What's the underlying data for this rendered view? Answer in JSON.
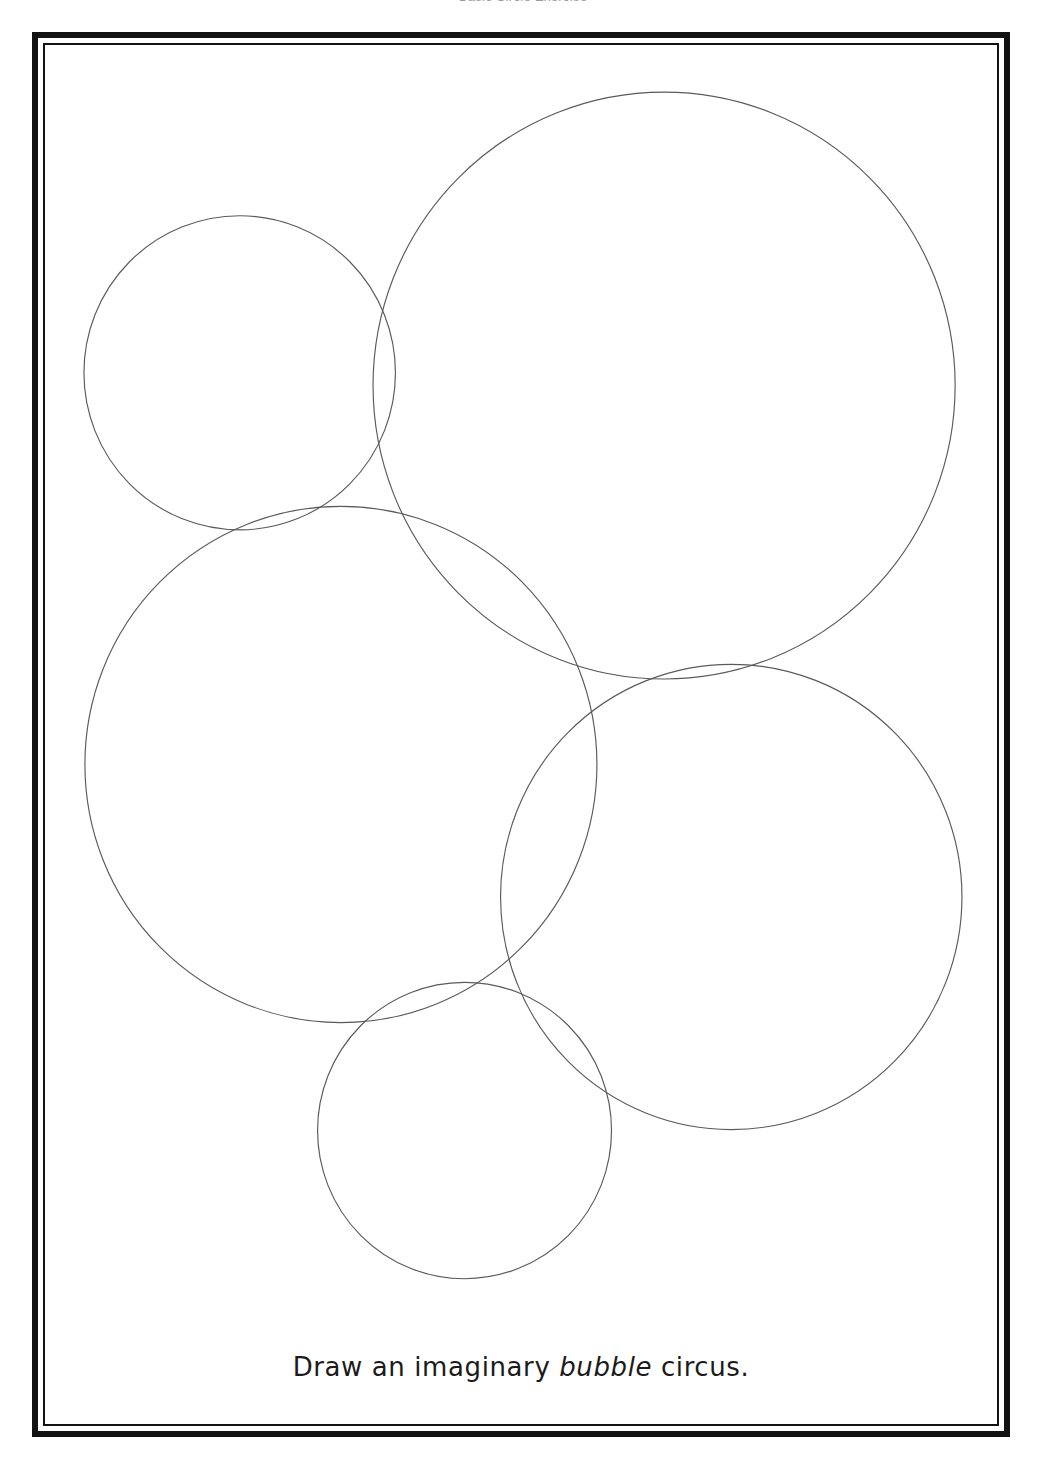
{
  "page": {
    "background_color": "#ffffff",
    "width": 1046,
    "height": 1471
  },
  "running_header": {
    "text": "Basic Circle Exercise"
  },
  "frame": {
    "style": "double-line-border",
    "outer_color": "#121212",
    "inner_color": "#121212",
    "left": 32,
    "top": 32,
    "width": 978,
    "height": 1405
  },
  "caption": {
    "prefix": "Draw an ",
    "emphasis": "bubble",
    "suffix": " circus.",
    "full_text": "Draw an imaginary bubble circus.",
    "lead": "imaginary ",
    "color": "#1b1b1b"
  },
  "chart_data": {
    "type": "scatter",
    "title": "Draw an imaginary bubble circus.",
    "xlabel": "",
    "ylabel": "",
    "xlim": [
      0,
      978
    ],
    "ylim": [
      0,
      1405
    ],
    "grid": false,
    "legend": "none",
    "stroke_color": "#5a5a5e",
    "stroke_width": 1.15,
    "fill": "none",
    "series": [
      {
        "name": "bubbles",
        "points": [
          {
            "id": "bubble-top-left-small",
            "cx": 200,
            "cy": 334,
            "r": 160
          },
          {
            "id": "bubble-top-right-large",
            "cx": 636,
            "cy": 347,
            "r": 299
          },
          {
            "id": "bubble-left-middle-large",
            "cx": 304,
            "cy": 733,
            "r": 263
          },
          {
            "id": "bubble-right-middle-large",
            "cx": 705,
            "cy": 868,
            "r": 237
          },
          {
            "id": "bubble-bottom-center-small",
            "cx": 431,
            "cy": 1106,
            "r": 151
          }
        ]
      }
    ]
  }
}
